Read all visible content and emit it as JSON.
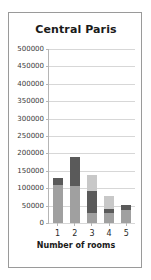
{
  "chart_data": {
    "type": "bar",
    "title": "Central Paris",
    "xlabel": "Number of rooms",
    "ylabel": "",
    "categories": [
      "1",
      "2",
      "3",
      "4",
      "5"
    ],
    "ylim": [
      0,
      500000
    ],
    "ytick_values": [
      0,
      50000,
      100000,
      150000,
      200000,
      250000,
      300000,
      350000,
      400000,
      450000,
      500000
    ],
    "ytick_labels": [
      "0",
      "50000",
      "100000",
      "150000",
      "200000",
      "250000",
      "300000",
      "350000",
      "400000",
      "450000",
      "500000"
    ],
    "grid": true,
    "legend": "none",
    "stacked": true,
    "series": [
      {
        "name": "segment-bottom",
        "color": "#a0a0a0",
        "values": [
          110000,
          105000,
          30000,
          28000,
          38000
        ]
      },
      {
        "name": "segment-middle",
        "color": "#5a5a5a",
        "values": [
          20000,
          85000,
          62000,
          12000,
          14000
        ]
      },
      {
        "name": "segment-top",
        "color": "#c8c8c8",
        "values": [
          0,
          0,
          46000,
          38000,
          0
        ]
      }
    ],
    "totals": [
      130000,
      190000,
      138000,
      78000,
      52000
    ]
  },
  "colors": {
    "card_border": "#9a9a9a",
    "axis": "#b5b5b5",
    "gridline": "#d7d7d7",
    "text": "#1a1a1a"
  }
}
